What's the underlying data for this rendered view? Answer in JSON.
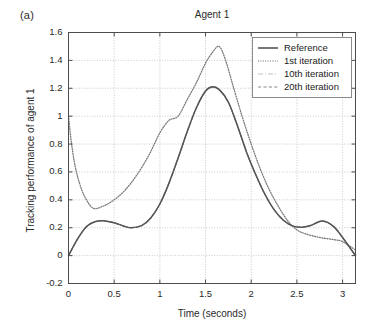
{
  "panel_label": "(a)",
  "chart_data": {
    "type": "line",
    "title": "Agent 1",
    "xlabel": "Time (seconds)",
    "ylabel": "Tracking performance of agent 1",
    "xlim": [
      0,
      3.1416
    ],
    "ylim": [
      -0.2,
      1.6
    ],
    "xticks": [
      0,
      0.5,
      1,
      1.5,
      2,
      2.5,
      3
    ],
    "xtick_labels": [
      "0",
      "0.5",
      "1",
      "1.5",
      "2",
      "2.5",
      "3"
    ],
    "yticks": [
      -0.2,
      0,
      0.2,
      0.4,
      0.6,
      0.8,
      1,
      1.2,
      1.4,
      1.6
    ],
    "ytick_labels": [
      "-0.2",
      "0",
      "0.2",
      "0.4",
      "0.6",
      "0.8",
      "1",
      "1.2",
      "1.4",
      "1.6"
    ],
    "grid": true,
    "legend_position": "upper right",
    "series": [
      {
        "name": "Reference",
        "style": "solid",
        "color": "#555555",
        "x": [
          0,
          0.1,
          0.2,
          0.3,
          0.38,
          0.5,
          0.6,
          0.68,
          0.8,
          0.9,
          1.0,
          1.1,
          1.2,
          1.3,
          1.4,
          1.5,
          1.57,
          1.65,
          1.75,
          1.85,
          1.95,
          2.05,
          2.15,
          2.25,
          2.35,
          2.45,
          2.55,
          2.65,
          2.78,
          2.9,
          3.0,
          3.1416
        ],
        "y": [
          0.0,
          0.12,
          0.21,
          0.245,
          0.25,
          0.235,
          0.213,
          0.2,
          0.215,
          0.27,
          0.37,
          0.52,
          0.7,
          0.89,
          1.06,
          1.18,
          1.21,
          1.19,
          1.1,
          0.93,
          0.74,
          0.58,
          0.44,
          0.33,
          0.255,
          0.213,
          0.203,
          0.216,
          0.248,
          0.21,
          0.13,
          0.0
        ]
      },
      {
        "name": "1st iteration",
        "style": "dotted",
        "color": "#7a7a7a",
        "x": [
          0,
          0.03,
          0.07,
          0.12,
          0.18,
          0.27,
          0.38,
          0.5,
          0.62,
          0.75,
          0.88,
          1.0,
          1.1,
          1.2,
          1.3,
          1.4,
          1.5,
          1.58,
          1.65,
          1.72,
          1.8,
          1.9,
          2.0,
          2.1,
          2.2,
          2.3,
          2.4,
          2.5,
          2.6,
          2.75,
          2.9,
          3.0,
          3.1416
        ],
        "y": [
          1.0,
          0.82,
          0.65,
          0.52,
          0.42,
          0.34,
          0.355,
          0.4,
          0.47,
          0.58,
          0.72,
          0.88,
          0.97,
          1.0,
          1.12,
          1.24,
          1.38,
          1.46,
          1.5,
          1.4,
          1.22,
          1.0,
          0.8,
          0.62,
          0.47,
          0.35,
          0.25,
          0.185,
          0.155,
          0.13,
          0.115,
          0.1,
          0.04
        ]
      },
      {
        "name": "10th iteration",
        "style": "dashdot",
        "color": "#9a9a9a",
        "x": [
          0,
          0.1,
          0.2,
          0.3,
          0.38,
          0.5,
          0.6,
          0.68,
          0.8,
          0.9,
          1.0,
          1.1,
          1.2,
          1.3,
          1.4,
          1.5,
          1.57,
          1.65,
          1.75,
          1.85,
          1.95,
          2.05,
          2.15,
          2.25,
          2.35,
          2.45,
          2.55,
          2.65,
          2.78,
          2.9,
          3.0,
          3.1416
        ],
        "y": [
          0.0,
          0.12,
          0.21,
          0.245,
          0.25,
          0.235,
          0.213,
          0.2,
          0.215,
          0.27,
          0.37,
          0.52,
          0.7,
          0.89,
          1.06,
          1.18,
          1.21,
          1.19,
          1.1,
          0.93,
          0.74,
          0.58,
          0.44,
          0.33,
          0.255,
          0.213,
          0.203,
          0.216,
          0.248,
          0.21,
          0.13,
          0.0
        ]
      },
      {
        "name": "20th iteration",
        "style": "dashed",
        "color": "#8a8a8a",
        "x": [
          0,
          0.1,
          0.2,
          0.3,
          0.38,
          0.5,
          0.6,
          0.68,
          0.8,
          0.9,
          1.0,
          1.1,
          1.2,
          1.3,
          1.4,
          1.5,
          1.57,
          1.65,
          1.75,
          1.85,
          1.95,
          2.05,
          2.15,
          2.25,
          2.35,
          2.45,
          2.55,
          2.65,
          2.78,
          2.9,
          3.0,
          3.1416
        ],
        "y": [
          0.0,
          0.12,
          0.21,
          0.245,
          0.25,
          0.235,
          0.213,
          0.2,
          0.215,
          0.27,
          0.37,
          0.52,
          0.7,
          0.89,
          1.06,
          1.18,
          1.21,
          1.19,
          1.1,
          0.93,
          0.74,
          0.58,
          0.44,
          0.33,
          0.255,
          0.213,
          0.203,
          0.216,
          0.248,
          0.21,
          0.13,
          0.0
        ]
      }
    ]
  },
  "legend": {
    "items": [
      {
        "label": "Reference"
      },
      {
        "label": "1st iteration"
      },
      {
        "label": "10th iteration"
      },
      {
        "label": "20th iteration"
      }
    ]
  },
  "colors": {
    "axis": "#4d4d4d",
    "grid": "#bdbdbd",
    "background": "#ffffff"
  }
}
